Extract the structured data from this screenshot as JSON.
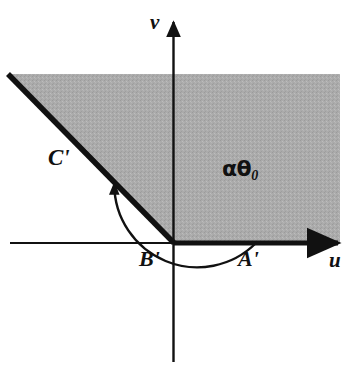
{
  "figure": {
    "background_color": "#ffffff",
    "shading_color": "#a8a8a8",
    "line_color": "#111111",
    "axes": {
      "horizontal_label": "u",
      "vertical_label": "v",
      "origin_label": "B'"
    },
    "labels": {
      "origin": "B'",
      "u_axis_point": "A'",
      "ray": "C'",
      "angle": "αθ",
      "angle_subscript": "0",
      "u_axis": "u",
      "v_axis": "v"
    },
    "geometry": {
      "origin": [
        173,
        243
      ],
      "ray_end": [
        8,
        74
      ],
      "ray_angle_degrees": 135,
      "arc_radius": 83,
      "arc_start_degrees": 0,
      "arc_end_degrees": 135,
      "region_top_y": 74,
      "region_right_x": 340,
      "u_axis_arrow_x": 345,
      "v_axis_arrow_y": 18,
      "v_axis_bottom_y": 362,
      "u_axis_left_x": 10
    }
  }
}
